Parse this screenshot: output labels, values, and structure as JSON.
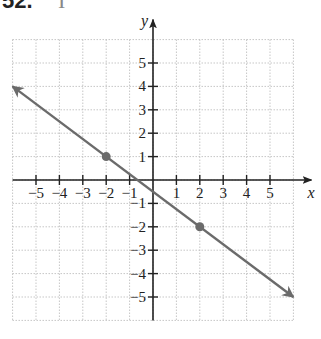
{
  "problem": {
    "number": "52.",
    "subtitle": "I"
  },
  "chart_data": {
    "type": "line",
    "title": "",
    "xlabel": "x",
    "ylabel": "y",
    "xlim": [
      -6,
      6
    ],
    "ylim": [
      -6,
      6
    ],
    "grid": true,
    "x_ticks": [
      -5,
      -4,
      -3,
      -2,
      -1,
      1,
      2,
      3,
      4,
      5
    ],
    "y_ticks": [
      -5,
      -4,
      -3,
      -2,
      -1,
      1,
      2,
      3,
      4,
      5
    ],
    "x_tick_labels": [
      "−5",
      "−4",
      "−3",
      "−2",
      "−1",
      "1",
      "2",
      "3",
      "4",
      "5"
    ],
    "y_tick_labels": [
      "−5",
      "−4",
      "−3",
      "−2",
      "−1",
      "1",
      "2",
      "3",
      "4",
      "5"
    ],
    "series": [
      {
        "name": "line",
        "equation": "y = -3/4 x - 1/2",
        "x": [
          -6,
          6
        ],
        "y": [
          4,
          -5
        ],
        "arrows": "both",
        "color": "#6b6b6b"
      }
    ],
    "points": [
      {
        "x": -2,
        "y": 1,
        "color": "#6b6b6b"
      },
      {
        "x": 2,
        "y": -2,
        "color": "#6b6b6b"
      }
    ]
  },
  "style": {
    "axis_color": "#222222",
    "grid_color": "#b8b8b8",
    "line_color": "#6b6b6b"
  }
}
